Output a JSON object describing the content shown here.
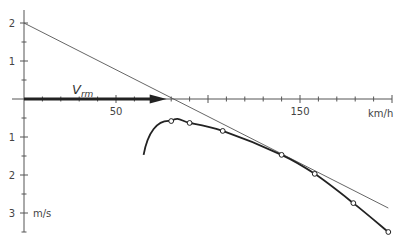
{
  "chart_data": {
    "type": "line",
    "title": "",
    "xlabel": "km/h",
    "ylabel": "m/s",
    "xlim": [
      0,
      200
    ],
    "ylim": [
      -3.5,
      2.3
    ],
    "x_ticks": [
      {
        "value": 50,
        "label": "50"
      },
      {
        "value": 150,
        "label": "150"
      }
    ],
    "y_ticks_upper": [
      {
        "value": 2,
        "label": "2"
      },
      {
        "value": 1,
        "label": "1"
      }
    ],
    "y_ticks_lower": [
      {
        "value": -1,
        "label": "1"
      },
      {
        "value": -2,
        "label": "2"
      },
      {
        "value": -3,
        "label": "3"
      }
    ],
    "annotation": {
      "label": "V",
      "subscript": "rm",
      "arrow_from": 0,
      "arrow_to": 77
    },
    "series": [
      {
        "name": "tangent line",
        "style": "thin",
        "x": [
          0,
          198
        ],
        "y": [
          2.0,
          -2.87
        ]
      },
      {
        "name": "measured curve",
        "style": "thick",
        "markers": "open-circle",
        "x": [
          80,
          90,
          108,
          140,
          158,
          179,
          198
        ],
        "y": [
          -0.58,
          -0.63,
          -0.84,
          -1.47,
          -1.97,
          -2.74,
          -3.5
        ],
        "curve_start": {
          "x": 65,
          "y": -1.47
        }
      }
    ],
    "grid": false,
    "legend": null
  },
  "labels": {
    "x_unit": "km/h",
    "y_unit": "m/s",
    "vrm_main": "V",
    "vrm_sub": "rm"
  }
}
